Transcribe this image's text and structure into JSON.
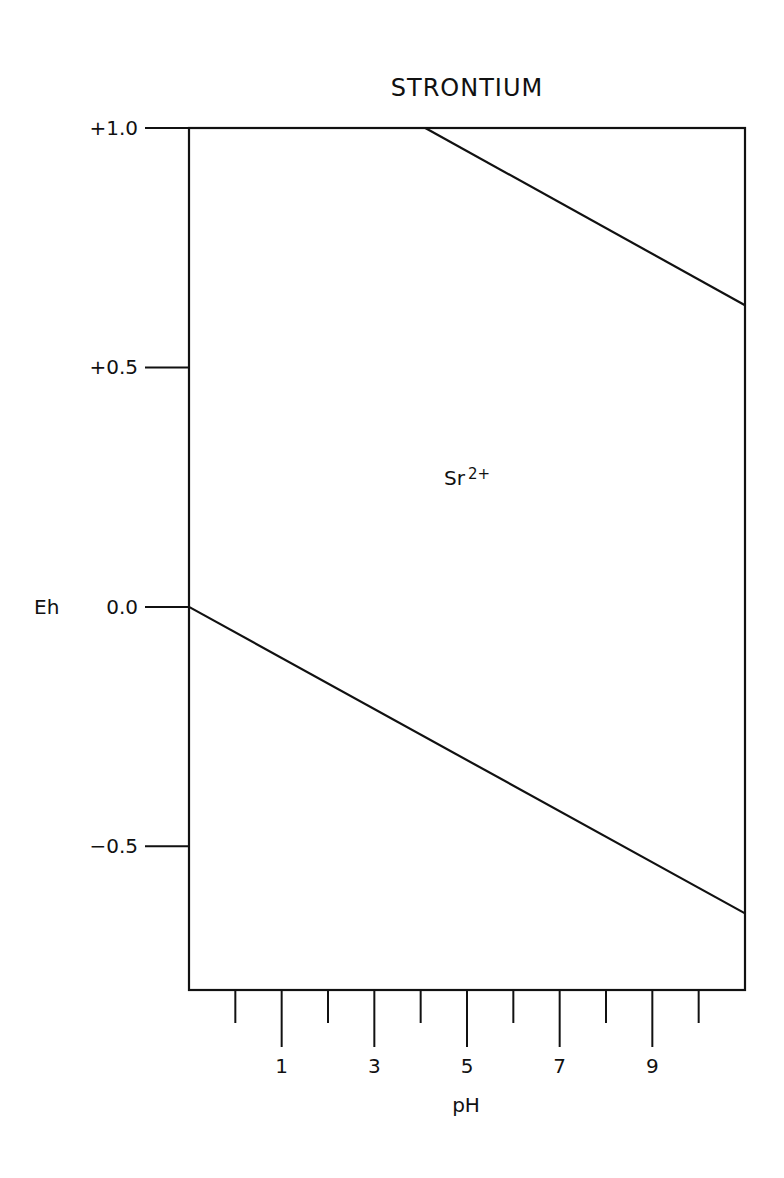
{
  "chart_data": {
    "type": "line",
    "title": "STRONTIUM",
    "xlabel": "pH",
    "ylabel": "Eh",
    "xlim": [
      -1,
      11
    ],
    "ylim": [
      -0.8,
      1.0
    ],
    "grid": false,
    "x_ticks": [
      {
        "value": 0,
        "label": "",
        "major": false
      },
      {
        "value": 1,
        "label": "1",
        "major": true
      },
      {
        "value": 2,
        "label": "",
        "major": false
      },
      {
        "value": 3,
        "label": "3",
        "major": true
      },
      {
        "value": 4,
        "label": "",
        "major": false
      },
      {
        "value": 5,
        "label": "5",
        "major": true
      },
      {
        "value": 6,
        "label": "",
        "major": false
      },
      {
        "value": 7,
        "label": "7",
        "major": true
      },
      {
        "value": 8,
        "label": "",
        "major": false
      },
      {
        "value": 9,
        "label": "9",
        "major": true
      },
      {
        "value": 10,
        "label": "",
        "major": false
      }
    ],
    "y_ticks": [
      {
        "value": 1.0,
        "label": "+1.0"
      },
      {
        "value": 0.5,
        "label": "+0.5"
      },
      {
        "value": 0.0,
        "label": "0.0"
      },
      {
        "value": -0.5,
        "label": "-0.5"
      }
    ],
    "series": [
      {
        "name": "upper-boundary",
        "x": [
          4.1,
          11
        ],
        "y": [
          1.0,
          0.63
        ]
      },
      {
        "name": "lower-boundary",
        "x": [
          -1,
          11
        ],
        "y": [
          0.0,
          -0.64
        ]
      }
    ],
    "annotations": [
      {
        "text": "Sr",
        "superscript": "2+",
        "x": 5.0,
        "y": 0.27
      }
    ]
  }
}
